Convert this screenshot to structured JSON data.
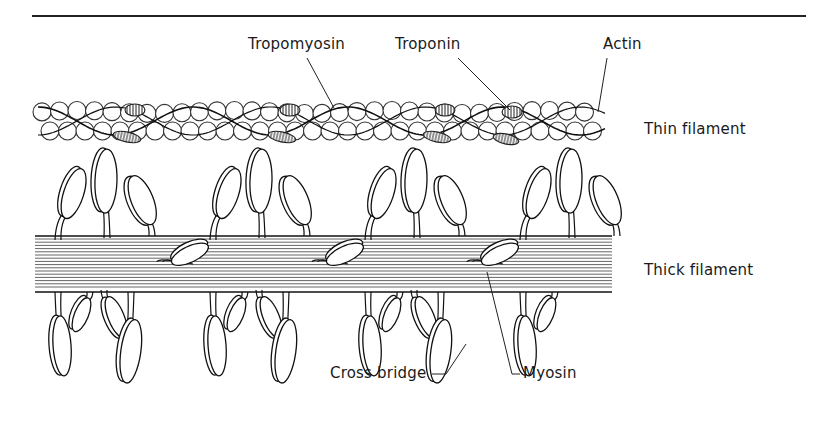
{
  "figure": {
    "colors": {
      "ink": "#1a1a1a",
      "background": "#ffffff"
    }
  },
  "labels": {
    "tropomyosin": "Tropomyosin",
    "troponin": "Troponin",
    "actin": "Actin",
    "thin_filament": "Thin filament",
    "thick_filament": "Thick filament",
    "cross_bridge": "Cross bridge",
    "myosin": "Myosin"
  }
}
